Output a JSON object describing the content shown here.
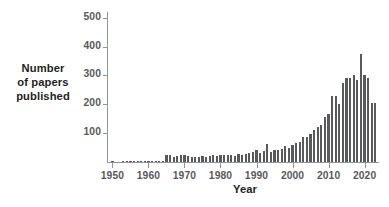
{
  "chart_data": {
    "type": "bar",
    "title": "",
    "xlabel": "Year",
    "ylabel_lines": [
      "Number",
      "of papers",
      "published"
    ],
    "ylabel": "Number of papers published",
    "ylim": [
      0,
      520
    ],
    "xlim": [
      1948.5,
      2024.0
    ],
    "grid": false,
    "legend": null,
    "ytick_labels": [
      "100",
      "200",
      "300",
      "400",
      "500"
    ],
    "ytick_values": [
      100,
      200,
      300,
      400,
      500
    ],
    "xtick_labels": [
      "1950",
      "1960",
      "1970",
      "1980",
      "1990",
      "2000",
      "2010",
      "2020"
    ],
    "xtick_values": [
      1950,
      1960,
      1970,
      1980,
      1990,
      2000,
      2010,
      2020
    ],
    "bar_color": "#58595b",
    "axis_color": "#939598",
    "x": [
      1950,
      1951,
      1952,
      1953,
      1954,
      1955,
      1956,
      1957,
      1958,
      1959,
      1960,
      1961,
      1962,
      1963,
      1964,
      1965,
      1966,
      1967,
      1968,
      1969,
      1970,
      1971,
      1972,
      1973,
      1974,
      1975,
      1976,
      1977,
      1978,
      1979,
      1980,
      1981,
      1982,
      1983,
      1984,
      1985,
      1986,
      1987,
      1988,
      1989,
      1990,
      1991,
      1992,
      1993,
      1994,
      1995,
      1996,
      1997,
      1998,
      1999,
      2000,
      2001,
      2002,
      2003,
      2004,
      2005,
      2006,
      2007,
      2008,
      2009,
      2010,
      2011,
      2012,
      2013,
      2014,
      2015,
      2016,
      2017,
      2018,
      2019,
      2020,
      2021,
      2022,
      2023
    ],
    "values": [
      1,
      0,
      0,
      2,
      2,
      1,
      1,
      2,
      4,
      2,
      2,
      4,
      3,
      3,
      3,
      25,
      26,
      17,
      22,
      23,
      25,
      20,
      18,
      16,
      18,
      21,
      18,
      22,
      25,
      22,
      24,
      26,
      23,
      24,
      22,
      27,
      25,
      28,
      30,
      36,
      43,
      32,
      37,
      61,
      36,
      40,
      42,
      46,
      56,
      49,
      60,
      66,
      70,
      86,
      85,
      96,
      110,
      122,
      127,
      157,
      168,
      230,
      230,
      200,
      275,
      290,
      290,
      300,
      285,
      375,
      300,
      290,
      205,
      205
    ]
  }
}
